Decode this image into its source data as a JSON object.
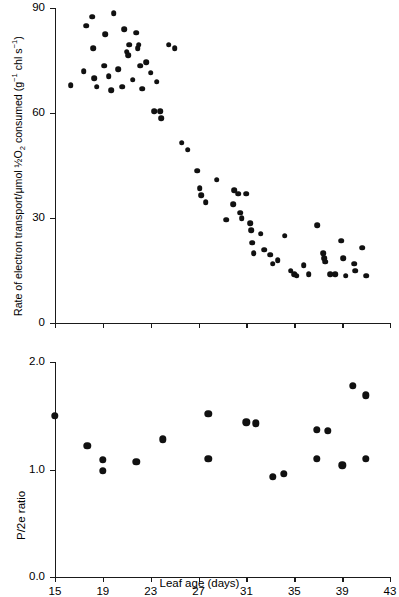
{
  "figure": {
    "xlabel": "Leaf age (days)"
  },
  "chart_data": [
    {
      "type": "scatter",
      "panel": "top",
      "title": "",
      "xlabel": "Leaf age (days)",
      "ylabel": "Rate of electron transport/μmol ½O₂ consumed (g⁻¹ chl s⁻¹)",
      "xlim": [
        15,
        43
      ],
      "ylim": [
        0,
        90
      ],
      "xticks": [
        15,
        19,
        23,
        27,
        31,
        35,
        39,
        43
      ],
      "xticklabels": [
        "15",
        "19",
        "23",
        "27",
        "31",
        "35",
        "39",
        "43"
      ],
      "yticks": [
        0,
        30,
        60,
        90
      ],
      "yticklabels": [
        "0",
        "30",
        "60",
        "90"
      ],
      "grid": false,
      "legend": null,
      "marker": "filled-circle",
      "color": "#111111",
      "points": [
        {
          "x": 16.3,
          "y": 68.0
        },
        {
          "x": 17.4,
          "y": 72.0
        },
        {
          "x": 17.6,
          "y": 85.0
        },
        {
          "x": 18.1,
          "y": 87.5
        },
        {
          "x": 18.2,
          "y": 78.5
        },
        {
          "x": 18.3,
          "y": 70.0
        },
        {
          "x": 18.5,
          "y": 67.5
        },
        {
          "x": 19.1,
          "y": 73.5
        },
        {
          "x": 19.2,
          "y": 82.5
        },
        {
          "x": 19.5,
          "y": 70.5
        },
        {
          "x": 19.7,
          "y": 66.5
        },
        {
          "x": 19.9,
          "y": 88.5
        },
        {
          "x": 20.3,
          "y": 72.5
        },
        {
          "x": 20.6,
          "y": 67.5
        },
        {
          "x": 20.8,
          "y": 84.0
        },
        {
          "x": 21.0,
          "y": 77.5
        },
        {
          "x": 21.1,
          "y": 76.5
        },
        {
          "x": 21.2,
          "y": 79.5
        },
        {
          "x": 21.5,
          "y": 69.5
        },
        {
          "x": 21.8,
          "y": 83.0
        },
        {
          "x": 21.9,
          "y": 78.5
        },
        {
          "x": 22.0,
          "y": 79.5
        },
        {
          "x": 22.1,
          "y": 73.5
        },
        {
          "x": 22.3,
          "y": 67.0
        },
        {
          "x": 22.6,
          "y": 74.5
        },
        {
          "x": 23.0,
          "y": 71.5
        },
        {
          "x": 23.3,
          "y": 60.5
        },
        {
          "x": 23.5,
          "y": 69.0
        },
        {
          "x": 23.8,
          "y": 60.5
        },
        {
          "x": 23.9,
          "y": 58.5
        },
        {
          "x": 24.5,
          "y": 79.5
        },
        {
          "x": 25.0,
          "y": 78.5
        },
        {
          "x": 25.6,
          "y": 51.5
        },
        {
          "x": 26.1,
          "y": 49.5
        },
        {
          "x": 26.9,
          "y": 43.5
        },
        {
          "x": 27.1,
          "y": 38.5
        },
        {
          "x": 27.2,
          "y": 36.5
        },
        {
          "x": 27.6,
          "y": 34.5
        },
        {
          "x": 28.5,
          "y": 41.0
        },
        {
          "x": 29.3,
          "y": 29.5
        },
        {
          "x": 29.9,
          "y": 34.0
        },
        {
          "x": 30.0,
          "y": 38.0
        },
        {
          "x": 30.3,
          "y": 37.0
        },
        {
          "x": 30.5,
          "y": 31.5
        },
        {
          "x": 30.6,
          "y": 30.0
        },
        {
          "x": 31.0,
          "y": 37.0
        },
        {
          "x": 31.3,
          "y": 28.5
        },
        {
          "x": 31.4,
          "y": 26.5
        },
        {
          "x": 31.5,
          "y": 23.0
        },
        {
          "x": 31.6,
          "y": 20.0
        },
        {
          "x": 32.2,
          "y": 25.5
        },
        {
          "x": 32.5,
          "y": 21.0
        },
        {
          "x": 33.0,
          "y": 19.5
        },
        {
          "x": 33.2,
          "y": 17.0
        },
        {
          "x": 33.6,
          "y": 18.0
        },
        {
          "x": 34.2,
          "y": 25.0
        },
        {
          "x": 34.7,
          "y": 15.0
        },
        {
          "x": 35.0,
          "y": 14.0
        },
        {
          "x": 35.2,
          "y": 13.5
        },
        {
          "x": 35.8,
          "y": 16.5
        },
        {
          "x": 36.2,
          "y": 14.0
        },
        {
          "x": 36.9,
          "y": 28.0
        },
        {
          "x": 37.4,
          "y": 20.0
        },
        {
          "x": 37.5,
          "y": 18.5
        },
        {
          "x": 37.6,
          "y": 17.5
        },
        {
          "x": 38.0,
          "y": 14.0
        },
        {
          "x": 38.4,
          "y": 14.0
        },
        {
          "x": 38.9,
          "y": 23.5
        },
        {
          "x": 39.1,
          "y": 18.5
        },
        {
          "x": 39.3,
          "y": 13.5
        },
        {
          "x": 40.0,
          "y": 17.0
        },
        {
          "x": 40.1,
          "y": 15.0
        },
        {
          "x": 40.7,
          "y": 21.5
        },
        {
          "x": 41.0,
          "y": 13.5
        }
      ]
    },
    {
      "type": "scatter",
      "panel": "bottom",
      "title": "",
      "xlabel": "Leaf age (days)",
      "ylabel": "P/2e ratio",
      "xlim": [
        15,
        43
      ],
      "ylim": [
        0.0,
        2.0
      ],
      "xticks": [
        15,
        19,
        23,
        27,
        31,
        35,
        39,
        43
      ],
      "xticklabels": [
        "15",
        "19",
        "23",
        "27",
        "31",
        "35",
        "39",
        "43"
      ],
      "yticks": [
        0.0,
        1.0,
        2.0
      ],
      "yticklabels": [
        "0.0",
        "1.0",
        "2.0"
      ],
      "grid": false,
      "legend": null,
      "marker": "filled-circle",
      "color": "#111111",
      "points": [
        {
          "x": 15.0,
          "y": 1.5
        },
        {
          "x": 17.7,
          "y": 1.22
        },
        {
          "x": 19.0,
          "y": 1.09
        },
        {
          "x": 19.0,
          "y": 0.99
        },
        {
          "x": 21.8,
          "y": 1.07
        },
        {
          "x": 24.0,
          "y": 1.28
        },
        {
          "x": 27.8,
          "y": 1.52
        },
        {
          "x": 27.8,
          "y": 1.1
        },
        {
          "x": 31.0,
          "y": 1.44
        },
        {
          "x": 31.8,
          "y": 1.43
        },
        {
          "x": 33.2,
          "y": 0.93
        },
        {
          "x": 34.1,
          "y": 0.96
        },
        {
          "x": 36.9,
          "y": 1.37
        },
        {
          "x": 36.9,
          "y": 1.1
        },
        {
          "x": 37.8,
          "y": 1.36
        },
        {
          "x": 39.0,
          "y": 1.04
        },
        {
          "x": 39.9,
          "y": 1.78
        },
        {
          "x": 41.0,
          "y": 1.69
        },
        {
          "x": 41.0,
          "y": 1.1
        }
      ]
    }
  ]
}
